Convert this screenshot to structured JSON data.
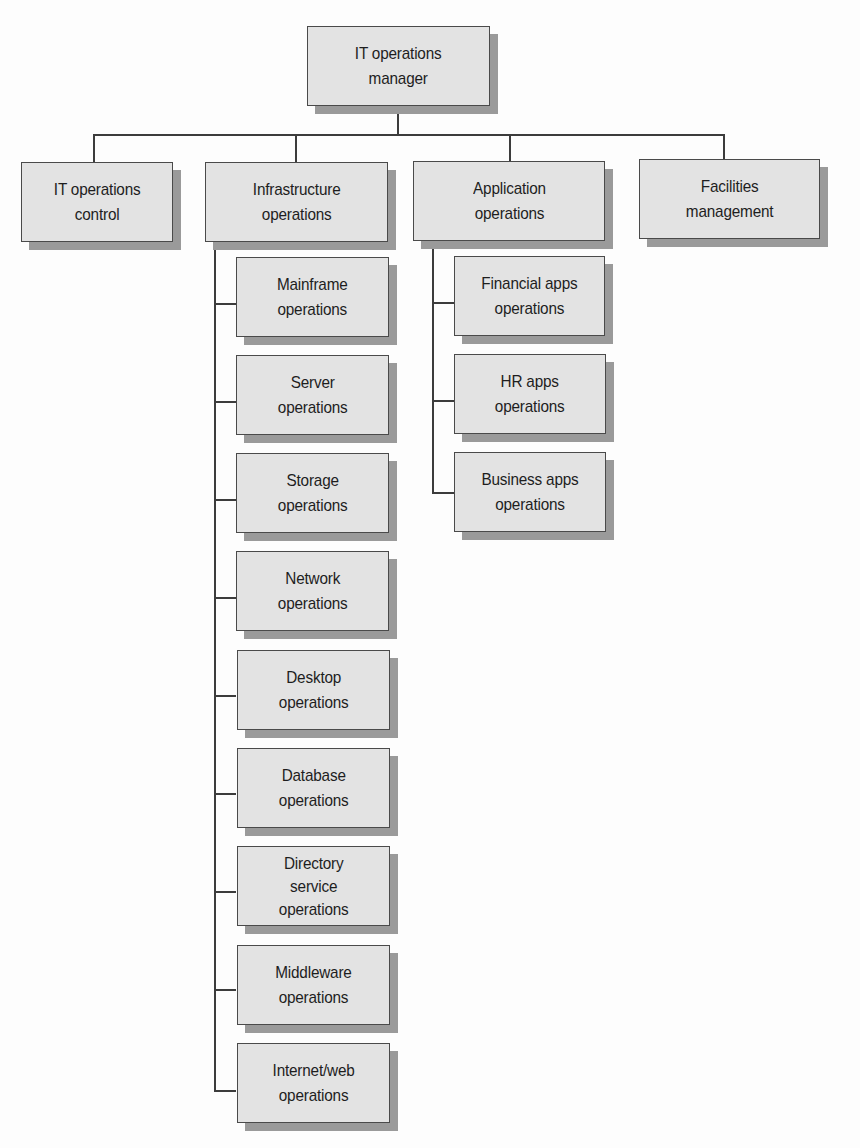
{
  "diagram": {
    "type": "org-chart",
    "root": {
      "label": "IT operations\nmanager"
    },
    "departments": [
      {
        "label": "IT operations\ncontrol",
        "children": []
      },
      {
        "label": "Infrastructure\noperations",
        "children": [
          {
            "label": "Mainframe\noperations"
          },
          {
            "label": "Server\noperations"
          },
          {
            "label": "Storage\noperations"
          },
          {
            "label": "Network\noperations"
          },
          {
            "label": "Desktop\noperations"
          },
          {
            "label": "Database\noperations"
          },
          {
            "label": "Directory\nservice\noperations"
          },
          {
            "label": "Middleware\noperations"
          },
          {
            "label": "Internet/web\noperations"
          }
        ]
      },
      {
        "label": "Application\noperations",
        "children": [
          {
            "label": "Financial apps\noperations"
          },
          {
            "label": "HR apps\noperations"
          },
          {
            "label": "Business apps\noperations"
          }
        ]
      },
      {
        "label": "Facilities\nmanagement",
        "children": []
      }
    ],
    "colors": {
      "box_fill": "#e3e3e3",
      "box_border": "#4a4a4a",
      "box_shadow": "#9a9a9a",
      "connector": "#3c3c3c",
      "text": "#1e1e1e",
      "background": "#fdfdfd"
    }
  }
}
